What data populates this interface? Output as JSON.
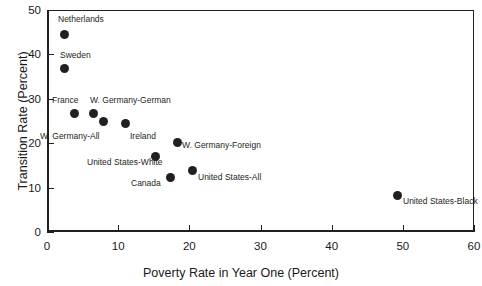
{
  "chart_data": {
    "type": "scatter",
    "title": "",
    "xlabel": "Poverty Rate in Year One (Percent)",
    "ylabel": "Transition Rate (Percent)",
    "xlim": [
      0,
      60
    ],
    "ylim": [
      0,
      50
    ],
    "xticks": [
      0,
      10,
      20,
      30,
      40,
      50,
      60
    ],
    "yticks": [
      0,
      10,
      20,
      30,
      40,
      50
    ],
    "xtick_labels": [
      "0",
      "10",
      "20",
      "30",
      "40",
      "50",
      "60"
    ],
    "ytick_labels": [
      "0",
      "10",
      "20",
      "30",
      "40",
      "50"
    ],
    "grid": false,
    "legend": false,
    "marker_color": "#231f20",
    "points": [
      {
        "label": "Netherlands",
        "x": 2.4,
        "y": 44.5,
        "lx": 58,
        "ly": 14
      },
      {
        "label": "Sweden",
        "x": 2.4,
        "y": 36.8,
        "lx": 60,
        "ly": 50
      },
      {
        "label": "France",
        "x": 3.9,
        "y": 26.8,
        "lx": 52,
        "ly": 95
      },
      {
        "label": "W. Germany-German",
        "x": 6.6,
        "y": 26.7,
        "lx": 90,
        "ly": 95
      },
      {
        "label": "W. Germany-All",
        "x": 8.0,
        "y": 24.8,
        "lx": 40,
        "ly": 131
      },
      {
        "label": "Ireland",
        "x": 11.0,
        "y": 24.5,
        "lx": 130,
        "ly": 131
      },
      {
        "label": "W. Germany-Foreign",
        "x": 18.3,
        "y": 20.1,
        "lx": 182,
        "ly": 140
      },
      {
        "label": "United States-White",
        "x": 15.3,
        "y": 17.0,
        "lx": 87,
        "ly": 157
      },
      {
        "label": "United States-All",
        "x": 20.4,
        "y": 13.9,
        "lx": 198,
        "ly": 172
      },
      {
        "label": "Canada",
        "x": 17.3,
        "y": 12.2,
        "lx": 131,
        "ly": 178
      },
      {
        "label": "United States-Black",
        "x": 49.3,
        "y": 8.2,
        "lx": 403,
        "ly": 196
      }
    ]
  }
}
